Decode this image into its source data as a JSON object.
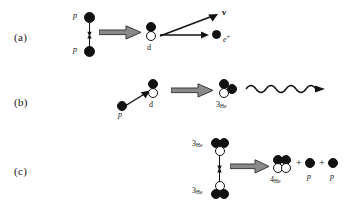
{
  "figure": {
    "ink_color": "#111111",
    "arrow_fill": "#8a8a8a",
    "arrow_stroke": "#3a3a3a"
  },
  "rows": [
    {
      "id": "a",
      "label": "(a)",
      "reactants": [
        {
          "name": "proton-top",
          "symbol": "p",
          "kind": "proton"
        },
        {
          "name": "proton-bottom",
          "symbol": "p",
          "kind": "proton"
        }
      ],
      "products": [
        {
          "name": "deuteron",
          "symbol": "d",
          "kind": "cluster",
          "composition": "1 proton + 1 neutron"
        },
        {
          "name": "neutrino",
          "symbol": "ν",
          "kind": "lepton"
        },
        {
          "name": "positron",
          "symbol": "e",
          "charge": "+",
          "kind": "lepton"
        }
      ],
      "equation": "p + p → d + ν + e⁺"
    },
    {
      "id": "b",
      "label": "(b)",
      "reactants": [
        {
          "name": "proton",
          "symbol": "p",
          "kind": "proton"
        },
        {
          "name": "deuteron",
          "symbol": "d",
          "kind": "cluster",
          "composition": "1 proton + 1 neutron"
        }
      ],
      "products": [
        {
          "name": "helium-3",
          "symbol": "3",
          "subscript": "He",
          "kind": "cluster",
          "composition": "2 protons + 1 neutron"
        },
        {
          "name": "photon",
          "symbol": "γ",
          "kind": "photon"
        }
      ],
      "equation": "p + d → ³He + γ"
    },
    {
      "id": "c",
      "label": "(c)",
      "reactants": [
        {
          "name": "helium-3-top",
          "symbol": "3",
          "subscript": "He",
          "kind": "cluster",
          "composition": "2 protons + 1 neutron"
        },
        {
          "name": "helium-3-bottom",
          "symbol": "3",
          "subscript": "He",
          "kind": "cluster",
          "composition": "2 protons + 1 neutron"
        }
      ],
      "products": [
        {
          "name": "helium-4",
          "symbol": "4",
          "subscript": "He",
          "kind": "cluster",
          "composition": "2 protons + 2 neutrons"
        },
        {
          "name": "proton-1",
          "symbol": "p",
          "kind": "proton"
        },
        {
          "name": "proton-2",
          "symbol": "p",
          "kind": "proton"
        }
      ],
      "operators": [
        "+",
        "+"
      ],
      "equation": "³He + ³He → ⁴He + p + p"
    }
  ],
  "labels": {
    "p": "p",
    "d": "d",
    "nu": "ν",
    "e": "e",
    "e_charge": "+",
    "he3_mass": "3",
    "he4_mass": "4",
    "he_sub": "He",
    "plus": "+"
  }
}
